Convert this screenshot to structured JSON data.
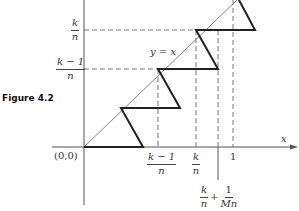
{
  "figure": {
    "caption": "Figure 4.2",
    "diagonal_label": "y = x",
    "x_axis_label": "x",
    "origin_label": "(0,0)",
    "y_ticks": [
      {
        "num": "k",
        "den": "n"
      },
      {
        "num": "k − 1",
        "den": "n"
      }
    ],
    "x_ticks": [
      {
        "num": "k − 1",
        "den": "n"
      },
      {
        "num": "k",
        "den": "n"
      },
      {
        "value": "1"
      }
    ],
    "extra_x_label": {
      "term1_num": "k",
      "term1_den": "n",
      "plus": "+",
      "term2_num": "1",
      "term2_den": "Mn"
    }
  },
  "colors": {
    "axis": "#555555",
    "diagonal": "#777777",
    "sawtooth": "#222222",
    "dashed": "#777777"
  }
}
